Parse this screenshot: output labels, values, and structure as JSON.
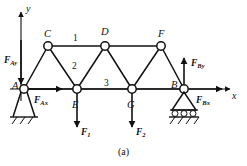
{
  "figure": {
    "caption": "(a)",
    "axes": {
      "y_label": "y",
      "x_label": "x"
    },
    "joints": [
      {
        "id": "A",
        "label": "A",
        "x": 24,
        "y": 89,
        "support": "pin"
      },
      {
        "id": "C",
        "label": "C",
        "x": 48,
        "y": 46,
        "support": "none"
      },
      {
        "id": "D",
        "label": "D",
        "x": 105,
        "y": 46,
        "support": "none"
      },
      {
        "id": "F",
        "label": "F",
        "x": 161,
        "y": 46,
        "support": "none"
      },
      {
        "id": "E",
        "label": "E",
        "x": 77,
        "y": 89,
        "support": "none"
      },
      {
        "id": "G",
        "label": "G",
        "x": 132,
        "y": 89,
        "support": "none"
      },
      {
        "id": "B",
        "label": "B",
        "x": 184,
        "y": 89,
        "support": "roller"
      }
    ],
    "members": [
      {
        "from": "A",
        "to": "C"
      },
      {
        "from": "C",
        "to": "D"
      },
      {
        "from": "D",
        "to": "F"
      },
      {
        "from": "A",
        "to": "E"
      },
      {
        "from": "E",
        "to": "G"
      },
      {
        "from": "G",
        "to": "B"
      },
      {
        "from": "C",
        "to": "E"
      },
      {
        "from": "E",
        "to": "D"
      },
      {
        "from": "D",
        "to": "G"
      },
      {
        "from": "G",
        "to": "F"
      },
      {
        "from": "F",
        "to": "B"
      }
    ],
    "member_numbers": [
      {
        "label": "1",
        "x": 73,
        "y": 34
      },
      {
        "label": "2",
        "x": 72,
        "y": 62
      },
      {
        "label": "3",
        "x": 104,
        "y": 79
      }
    ],
    "forces": [
      {
        "name": "F_Ay",
        "base": "F",
        "sub": "Ay",
        "direction": "down",
        "label_x": 4,
        "label_y": 56
      },
      {
        "name": "F_Ax",
        "base": "F",
        "sub": "Ax",
        "direction": "right",
        "label_x": 34,
        "label_y": 96
      },
      {
        "name": "F_By",
        "base": "F",
        "sub": "By",
        "direction": "up",
        "label_x": 193,
        "label_y": 59
      },
      {
        "name": "F_Bx",
        "base": "F",
        "sub": "Bx",
        "direction": "right",
        "label_x": 196,
        "label_y": 96
      },
      {
        "name": "F_1",
        "base": "F",
        "sub": "1",
        "direction": "down",
        "label_x": 81,
        "label_y": 128
      },
      {
        "name": "F_2",
        "base": "F",
        "sub": "2",
        "direction": "down",
        "label_x": 136,
        "label_y": 128
      }
    ],
    "colors": {
      "line": "#111111",
      "background": "#ffffff"
    }
  }
}
